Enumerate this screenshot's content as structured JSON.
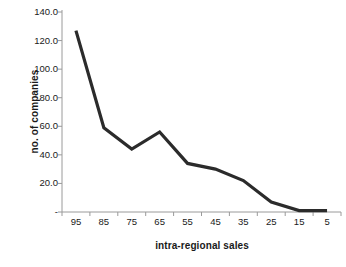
{
  "chart_data": {
    "type": "line",
    "title": "",
    "xlabel": "intra-regional sales",
    "ylabel": "no. of companies",
    "categories": [
      "95",
      "85",
      "75",
      "65",
      "55",
      "45",
      "35",
      "25",
      "15",
      "5"
    ],
    "values": [
      127,
      59,
      44,
      56,
      34,
      30,
      22,
      7,
      1,
      1
    ],
    "series": [
      {
        "name": "no. of companies",
        "values": [
          127,
          59,
          44,
          56,
          34,
          30,
          22,
          7,
          1,
          1
        ]
      }
    ],
    "ylim": [
      0,
      140
    ],
    "yticks": [
      "-",
      "20.0",
      "40.0",
      "60.0",
      "80.0",
      "100.0",
      "120.0",
      "140.0"
    ],
    "ytick_values": [
      0,
      20,
      40,
      60,
      80,
      100,
      120,
      140
    ],
    "xticks": [
      "95",
      "85",
      "75",
      "65",
      "55",
      "45",
      "35",
      "25",
      "15",
      "5"
    ],
    "grid": false,
    "legend": false,
    "legend_position": "none",
    "line_color": "#2b2b2b",
    "axis_color": "#9a9a9a",
    "background_color": "#ffffff"
  }
}
